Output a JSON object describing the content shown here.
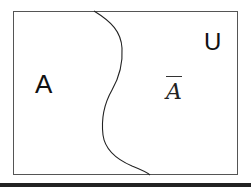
{
  "diagram": {
    "type": "venn-complement",
    "universe_label": "U",
    "set_label": "A",
    "complement_label": "A",
    "complement_notation": "overline",
    "colors": {
      "line": "#222222",
      "background": "#ffffff"
    }
  }
}
